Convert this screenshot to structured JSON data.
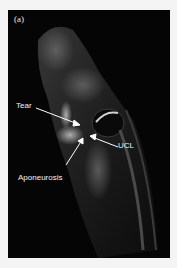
{
  "figure": {
    "panel_label": "(a)",
    "annotations": {
      "tear": "Tear",
      "ucl": "UCL",
      "aponeurosis": "Aponeurosis"
    },
    "colors": {
      "background": "#f4f4f4",
      "panel": "#050505",
      "label": "#f2f2f2"
    }
  }
}
